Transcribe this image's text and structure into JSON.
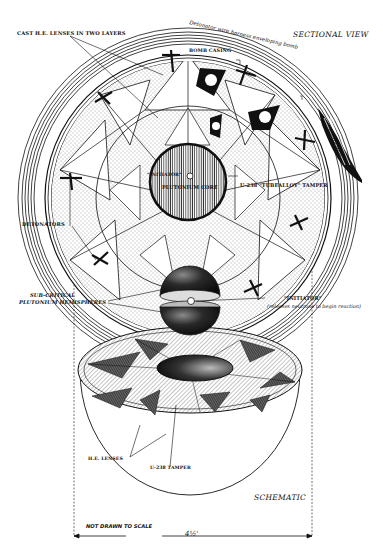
{
  "diagram": {
    "views": {
      "sectional_title": "SECTIONAL VIEW",
      "schematic_title": "SCHEMATIC"
    },
    "labels": {
      "he_lenses_two_layers": "CAST H.E. LENSES IN TWO LAYERS",
      "wire_harness": "Detonator wire harness enveloping bomb",
      "bomb_casing": "BOMB CASING",
      "firing_unit": "Firing unit",
      "initiator_top": "\"INITIATOR\"",
      "plutonium_core": "PLUTONIUM CORE",
      "tamper_top": "U-238 \"TUBEALLOY\" TAMPER",
      "detonators": "DETONATORS",
      "hemispheres_line1": "SUB-CRITICAL",
      "hemispheres_line2": "PLUTONIUM HEMISPHERES",
      "initiator_side": "\"INITIATOR\"",
      "initiator_note": "(releases neutrons to begin reaction)",
      "he_lenses": "H.E. LENSES",
      "tamper_bottom": "U-238 TAMPER",
      "not_to_scale": "NOT DRAWN TO SCALE",
      "dimension": "4½'"
    },
    "colors": {
      "ink": "#111111",
      "paper": "#ffffff",
      "stipple": "#555555"
    }
  }
}
